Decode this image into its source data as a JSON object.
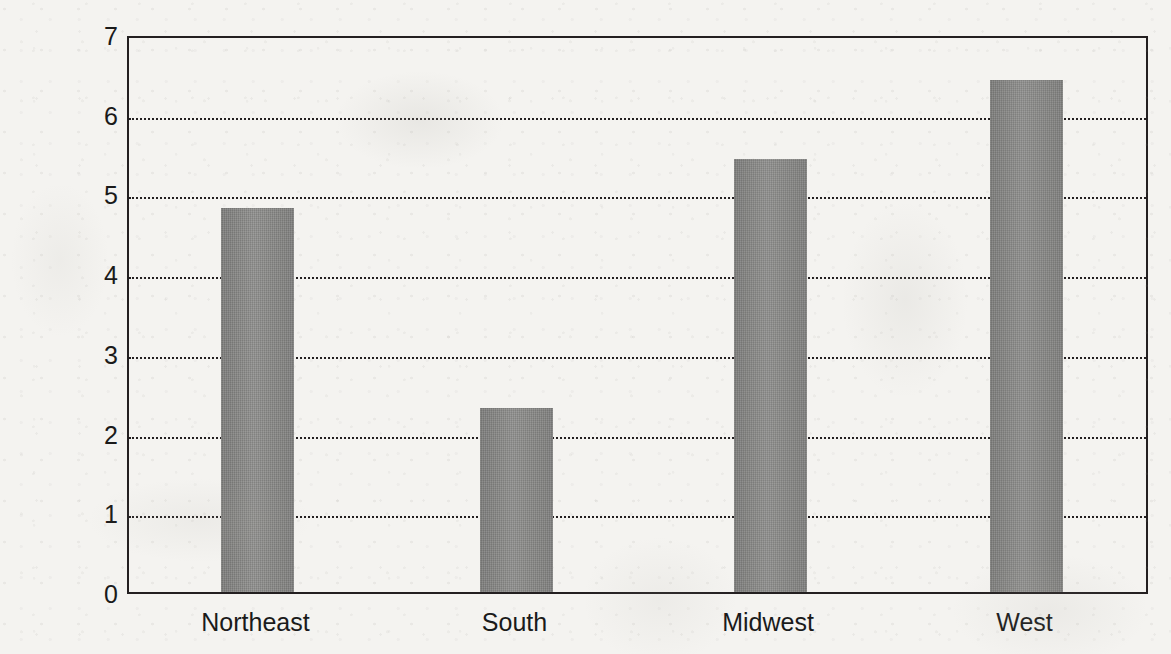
{
  "chart_data": {
    "type": "bar",
    "title": "",
    "subtitle": "",
    "xlabel": "",
    "ylabel": "tons/daythroughput/million persons",
    "categories": [
      "Northeast",
      "South",
      "Midwest",
      "West"
    ],
    "values": [
      4.82,
      2.31,
      5.43,
      6.42
    ],
    "series": [
      {
        "name": "throughput",
        "values": [
          4.82,
          2.31,
          5.43,
          6.42
        ]
      }
    ],
    "ylim": [
      0,
      7
    ],
    "yticks": [
      0,
      1,
      2,
      3,
      4,
      5,
      6,
      7
    ],
    "ytick_labels": [
      "0",
      "1",
      "2",
      "3",
      "4",
      "5",
      "6",
      "7"
    ],
    "grid": true,
    "grid_style": "dotted-horizontal",
    "legend": false,
    "legend_position": "none",
    "bar_color": "#898987",
    "axis_color": "#231f20",
    "background_color": "#f4f3f0",
    "annotations": []
  },
  "axis": {
    "y_title": "tons/daythroughput/million persons"
  }
}
